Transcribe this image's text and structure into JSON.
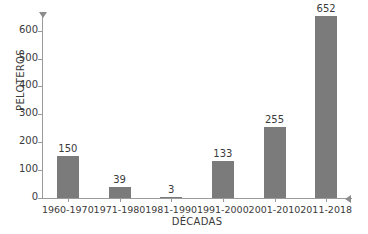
{
  "chart_data": {
    "type": "bar",
    "title": "",
    "subtitle": "",
    "xlabel": "DÉCADAS",
    "ylabel": "PELOTEROS",
    "categories": [
      "1960-1970",
      "1971-1980",
      "1981-1990",
      "1991-2000",
      "2001-2010",
      "2011-2018"
    ],
    "values": [
      150,
      39,
      3,
      133,
      255,
      652
    ],
    "value_labels": [
      "150",
      "39",
      "3",
      "133",
      "255",
      "652"
    ],
    "ylim": [
      0,
      660
    ],
    "ytick_values": [
      0,
      100,
      200,
      300,
      400,
      500,
      600
    ],
    "ytick_labels": [
      "0",
      "100",
      "200",
      "300",
      "400",
      "500",
      "600"
    ],
    "grid": false,
    "legend": false,
    "legend_position": "none",
    "series": [
      {
        "name": "PELOTEROS",
        "values": [
          150,
          39,
          3,
          133,
          255,
          652
        ]
      }
    ],
    "bar_color": "#7b7b7b",
    "axis_color": "#9a9a9a",
    "text_color": "#3b3b3b",
    "background_color": "#ffffff",
    "annotations": []
  }
}
